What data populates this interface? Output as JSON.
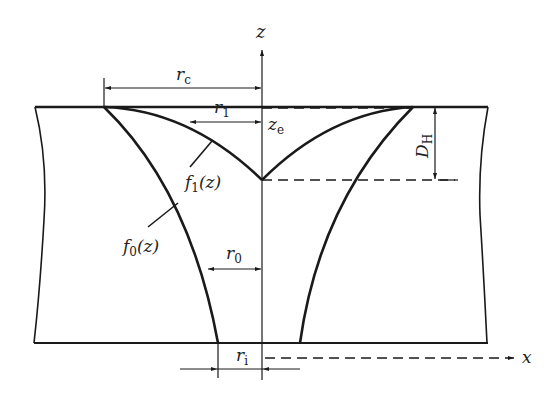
{
  "diagram": {
    "type": "cross-section schematic",
    "colors": {
      "stroke": "#1a1a1a",
      "background": "#ffffff"
    },
    "axes": {
      "z": {
        "label": "z"
      },
      "x": {
        "label": "x"
      }
    },
    "labels": {
      "rc": {
        "main": "r",
        "sub": "c"
      },
      "r1": {
        "main": "r",
        "sub": "1"
      },
      "r0": {
        "main": "r",
        "sub": "0"
      },
      "ri": {
        "main": "r",
        "sub": "i"
      },
      "ze": {
        "main": "z",
        "sub": "e"
      },
      "DH": {
        "main": "D",
        "sub": "H"
      },
      "f1": {
        "pre": "f",
        "sub": "1",
        "post": "(z)"
      },
      "f0": {
        "pre": "f",
        "sub": "0",
        "post": "(z)"
      }
    }
  }
}
